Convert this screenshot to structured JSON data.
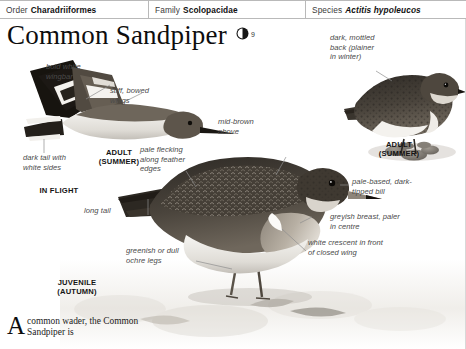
{
  "taxonomy": {
    "order_key": "Order",
    "order_value": "Charadriiformes",
    "family_key": "Family",
    "family_value": "Scolopacidae",
    "species_key": "Species",
    "species_value": "Actitis hypoleucos"
  },
  "title": {
    "name": "Common Sandpiper",
    "sound_icon": "speaker-icon",
    "sound_number": "9"
  },
  "annotations": {
    "bold_white_wingbar": "bold white\nwingbar",
    "stiff_bowed_wings": "stiff, bowed\nwings",
    "dark_tail_white_sides": "dark tail with\nwhite sides",
    "pale_flecking": "pale flecking\nalong feather\nedges",
    "mid_brown_above": "mid-brown\nabove",
    "long_tail": "long tail",
    "dark_mottled_back": "dark, mottled\nback (plainer\nin winter)",
    "pale_based_bill": "pale-based, dark-\ntipped bill",
    "greyish_breast": "greyish breast, paler\nin centre",
    "white_crescent": "white crescent in front\nof closed wing",
    "greenish_legs": "greenish or dull\nochre legs"
  },
  "captions": {
    "in_flight_adult": "ADULT\n(SUMMER)",
    "in_flight": "IN FLIGHT",
    "juvenile": "JUVENILE\n(AUTUMN)",
    "adult_summer_right": "ADULT\n(SUMMER)"
  },
  "body": {
    "dropcap": "A",
    "text": "common wader, the Common Sandpiper is"
  },
  "colors": {
    "rule": "#b9b9b9",
    "label_text": "#4a4a4a",
    "caption_text": "#141414",
    "leader": "#8e8e8e",
    "plumage_dark": "#3a352f",
    "plumage_mid": "#6d6459",
    "plumage_light": "#e9e6e0"
  }
}
